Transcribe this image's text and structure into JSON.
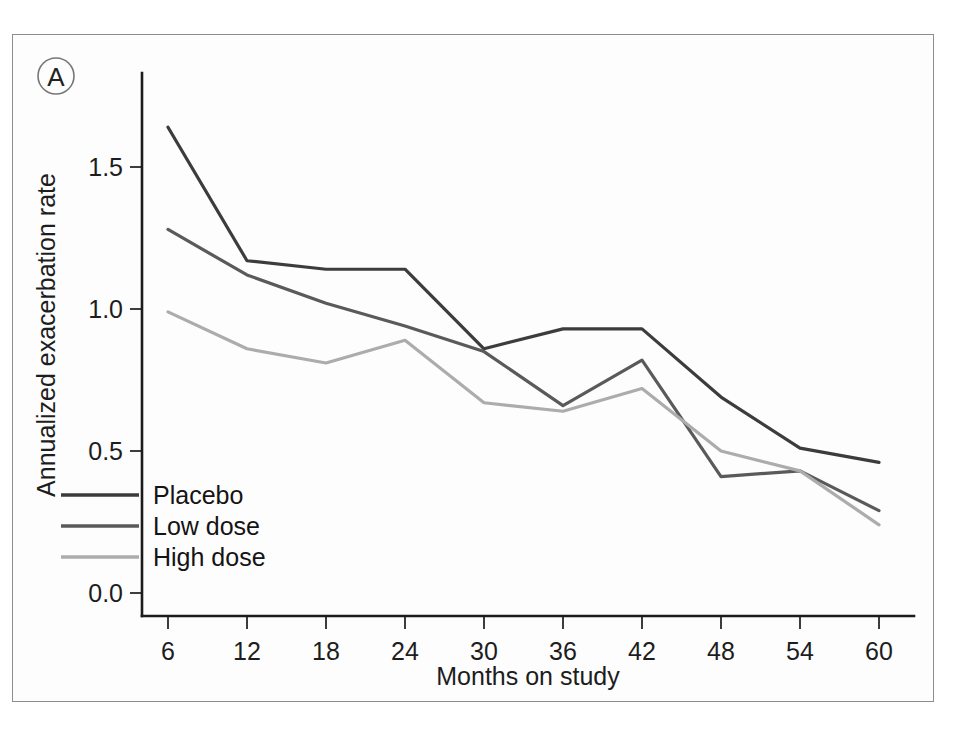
{
  "figure": {
    "panel_label": "A",
    "background_color": "#ffffff",
    "frame_color": "#8d8d8d"
  },
  "chart_data": {
    "type": "line",
    "title": "",
    "xlabel": "Months on study",
    "ylabel": "Annualized exacerbation rate",
    "x": [
      6,
      12,
      18,
      24,
      30,
      36,
      42,
      48,
      54,
      60
    ],
    "categories": [
      "6",
      "12",
      "18",
      "24",
      "30",
      "36",
      "42",
      "48",
      "54",
      "60"
    ],
    "xtick_labels": [
      "6",
      "12",
      "18",
      "24",
      "30",
      "36",
      "42",
      "48",
      "54",
      "60"
    ],
    "ytick_labels": [
      "0.0",
      "0.5",
      "1.0",
      "1.5"
    ],
    "yticks": [
      0.0,
      0.5,
      1.0,
      1.5
    ],
    "ylim": [
      -0.05,
      1.72
    ],
    "xlim": [
      4.0,
      62.0
    ],
    "grid": false,
    "legend_position": "lower-left-inside",
    "series": [
      {
        "name": "Placebo",
        "color": "#3c3c3c",
        "values": [
          1.64,
          1.17,
          1.14,
          1.14,
          0.86,
          0.93,
          0.93,
          0.69,
          0.51,
          0.46
        ]
      },
      {
        "name": "Low dose",
        "color": "#5a5a5a",
        "values": [
          1.28,
          1.12,
          1.02,
          0.94,
          0.85,
          0.66,
          0.82,
          0.41,
          0.43,
          0.29
        ]
      },
      {
        "name": "High dose",
        "color": "#acacac",
        "values": [
          0.99,
          0.86,
          0.81,
          0.89,
          0.67,
          0.64,
          0.72,
          0.5,
          0.43,
          0.24
        ]
      }
    ],
    "legend": [
      "Placebo",
      "Low dose",
      "High dose"
    ]
  }
}
